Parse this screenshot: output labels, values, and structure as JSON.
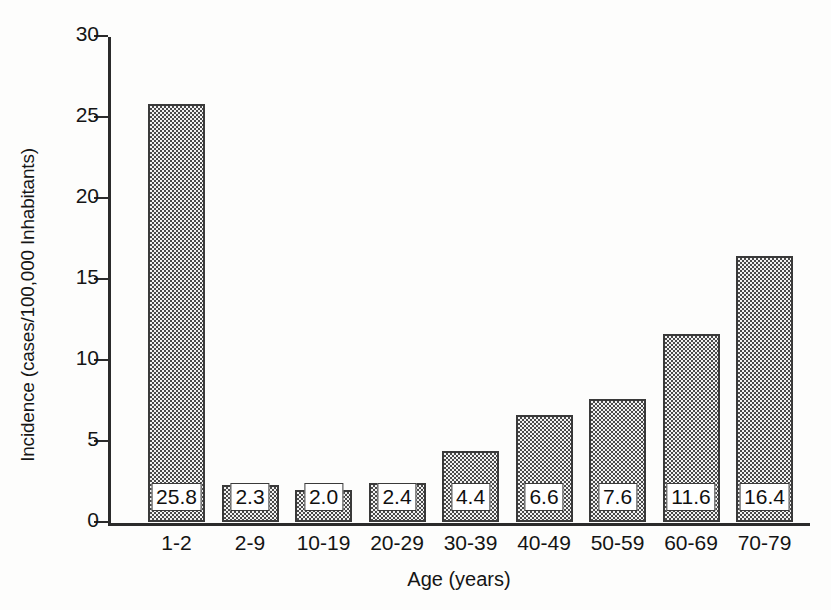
{
  "chart_data": {
    "type": "bar",
    "title": "",
    "xlabel": "Age (years)",
    "ylabel": "Incidence (cases/100,000 Inhabitants)",
    "categories": [
      "1-2",
      "2-9",
      "10-19",
      "20-29",
      "30-39",
      "40-49",
      "50-59",
      "60-69",
      "70-79"
    ],
    "values": [
      25.8,
      2.3,
      2.0,
      2.4,
      4.4,
      6.6,
      7.6,
      11.6,
      16.4
    ],
    "value_labels": [
      "25.8",
      "2.3",
      "2.0",
      "2.4",
      "4.4",
      "6.6",
      "7.6",
      "11.6",
      "16.4"
    ],
    "ylim": [
      0,
      30
    ],
    "yticks": [
      0,
      5,
      10,
      15,
      20,
      25,
      30
    ],
    "ytick_labels": [
      "0",
      "5",
      "10",
      "15",
      "20",
      "25",
      "30"
    ],
    "grid": false,
    "legend": false,
    "legend_position": "none",
    "bar_fill": "#4a4a4a",
    "bar_edge": "#3a3a3a",
    "axis_color": "#2b2b2b",
    "label_box_fill": "#ffffff"
  }
}
